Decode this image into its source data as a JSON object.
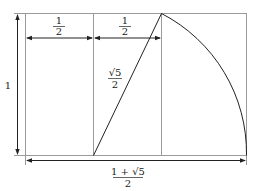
{
  "diagram": {
    "labels": {
      "height": "1",
      "half_left_num": "1",
      "half_left_den": "2",
      "half_right_num": "1",
      "half_right_den": "2",
      "diagonal_num": "√5",
      "diagonal_den": "2",
      "width_num": "1 + √5",
      "width_den": "2"
    },
    "colors": {
      "frame": "#9a9a9a",
      "stroke": "#222222"
    }
  }
}
